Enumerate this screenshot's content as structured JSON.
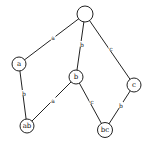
{
  "diagram": {
    "type": "lattice",
    "nodes": [
      {
        "id": "root",
        "label": "",
        "x": 85,
        "y": 14,
        "r": 8
      },
      {
        "id": "a",
        "label": "a",
        "x": 19,
        "y": 64,
        "r": 7
      },
      {
        "id": "b",
        "label": "b",
        "x": 76,
        "y": 77,
        "r": 7
      },
      {
        "id": "c",
        "label": "c",
        "x": 134,
        "y": 85,
        "r": 7
      },
      {
        "id": "ab",
        "label": "ab",
        "x": 27,
        "y": 126,
        "r": 7
      },
      {
        "id": "bc",
        "label": "bc",
        "x": 105,
        "y": 130,
        "r": 7.5
      }
    ],
    "edges": [
      {
        "from": "root",
        "to": "a",
        "label": "a",
        "lx": 53,
        "ly": 37
      },
      {
        "from": "root",
        "to": "b",
        "label": "b",
        "lx": 82,
        "ly": 44
      },
      {
        "from": "root",
        "to": "c",
        "label": "c",
        "lx": 111,
        "ly": 48
      },
      {
        "from": "a",
        "to": "ab",
        "label": "b",
        "lx": 24,
        "ly": 93
      },
      {
        "from": "b",
        "to": "ab",
        "label": "a",
        "lx": 53,
        "ly": 100
      },
      {
        "from": "b",
        "to": "bc",
        "label": "c",
        "lx": 92,
        "ly": 101
      },
      {
        "from": "c",
        "to": "bc",
        "label": "b",
        "lx": 121,
        "ly": 105
      }
    ]
  }
}
